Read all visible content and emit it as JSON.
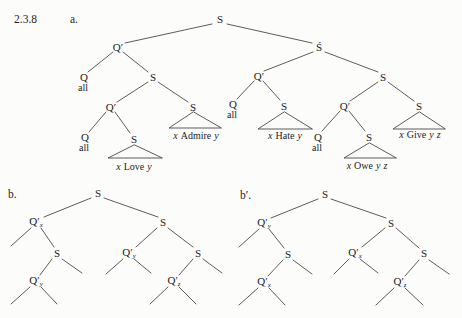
{
  "header": {
    "exercise_number": "2.3.8",
    "item_a": "a."
  },
  "labels": {
    "s": "S",
    "s_accented": "Ś",
    "q_prime": "Q′",
    "q": "Q",
    "quantifier_word": "all"
  },
  "tree_a": {
    "leaf_love": {
      "subject": "x",
      "predicate": "Love",
      "object": "y"
    },
    "leaf_admire": {
      "subject": "x",
      "predicate": "Admire",
      "object": "y"
    },
    "leaf_hate": {
      "subject": "x",
      "predicate": "Hate",
      "object": "y"
    },
    "leaf_owe": {
      "subject": "x",
      "predicate": "Owe",
      "object": "y",
      "object2": "z"
    },
    "leaf_give": {
      "subject": "x",
      "predicate": "Give",
      "object": "y",
      "object2": "z"
    }
  },
  "tree_b": {
    "item_label": "b.",
    "subscripts": {
      "upper_left": "x",
      "lower_left": "y",
      "upper_right": "y",
      "lower_right": "z"
    }
  },
  "tree_b_prime": {
    "item_label": "b′.",
    "subscripts": {
      "upper_left": "y",
      "lower_left": "x",
      "upper_right": "x",
      "lower_right": "z"
    }
  },
  "colors": {
    "paper": "#fcfcfa",
    "ink": "#222222",
    "line": "#4a4a4a"
  }
}
